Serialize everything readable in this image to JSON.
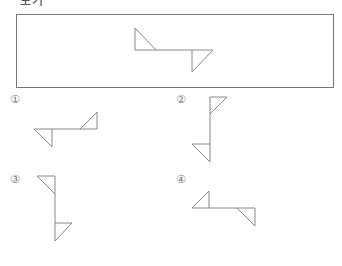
{
  "header": {
    "cut_text": "보기"
  },
  "problem": {
    "frame": {
      "x": 16,
      "y": 14,
      "width": 317,
      "height": 73
    },
    "main_figure": {
      "segments": [
        [
          135,
          28,
          135,
          50
        ],
        [
          135,
          28,
          156,
          50
        ],
        [
          135,
          50,
          213,
          50
        ],
        [
          192,
          50,
          192,
          72
        ],
        [
          192,
          72,
          213,
          50
        ]
      ]
    }
  },
  "options": [
    {
      "label": "①",
      "label_pos": [
        10,
        93
      ],
      "segments": [
        [
          34,
          129,
          97,
          129
        ],
        [
          34,
          129,
          52,
          147
        ],
        [
          52,
          129,
          52,
          147
        ],
        [
          80,
          129,
          97,
          112
        ],
        [
          97,
          112,
          97,
          129
        ]
      ]
    },
    {
      "label": "②",
      "label_pos": [
        176,
        93
      ],
      "segments": [
        [
          210,
          97,
          210,
          162
        ],
        [
          210,
          97,
          227,
          97
        ],
        [
          227,
          97,
          210,
          114
        ],
        [
          192,
          144,
          210,
          144
        ],
        [
          192,
          144,
          210,
          162
        ]
      ]
    },
    {
      "label": "③",
      "label_pos": [
        10,
        173
      ],
      "segments": [
        [
          55,
          176,
          55,
          241
        ],
        [
          37,
          176,
          55,
          176
        ],
        [
          37,
          176,
          55,
          194
        ],
        [
          55,
          223,
          72,
          223
        ],
        [
          72,
          223,
          55,
          241
        ]
      ]
    },
    {
      "label": "④",
      "label_pos": [
        176,
        173
      ],
      "segments": [
        [
          192,
          208,
          255,
          208
        ],
        [
          192,
          208,
          209,
          191
        ],
        [
          209,
          191,
          209,
          208
        ],
        [
          237,
          208,
          255,
          226
        ],
        [
          255,
          208,
          255,
          226
        ]
      ]
    }
  ],
  "colors": {
    "line": "#888888",
    "frame": "#777777"
  }
}
